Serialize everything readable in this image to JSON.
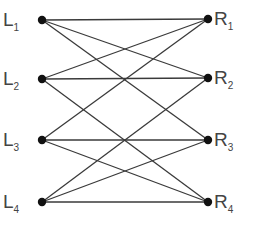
{
  "diagram": {
    "type": "bipartite-graph",
    "left_nodes": [
      {
        "id": "L1",
        "letter": "L",
        "sub": "1",
        "x": 42,
        "y": 20
      },
      {
        "id": "L2",
        "letter": "L",
        "sub": "2",
        "x": 42,
        "y": 79
      },
      {
        "id": "L3",
        "letter": "L",
        "sub": "3",
        "x": 42,
        "y": 140
      },
      {
        "id": "L4",
        "letter": "L",
        "sub": "4",
        "x": 42,
        "y": 202
      }
    ],
    "right_nodes": [
      {
        "id": "R1",
        "letter": "R",
        "sub": "1",
        "x": 208,
        "y": 19
      },
      {
        "id": "R2",
        "letter": "R",
        "sub": "2",
        "x": 208,
        "y": 78
      },
      {
        "id": "R3",
        "letter": "R",
        "sub": "3",
        "x": 208,
        "y": 140
      },
      {
        "id": "R4",
        "letter": "R",
        "sub": "4",
        "x": 208,
        "y": 202
      }
    ],
    "edges": [
      [
        "L1",
        "R1"
      ],
      [
        "L1",
        "R2"
      ],
      [
        "L1",
        "R3"
      ],
      [
        "L2",
        "R1"
      ],
      [
        "L2",
        "R2"
      ],
      [
        "L2",
        "R4"
      ],
      [
        "L3",
        "R1"
      ],
      [
        "L3",
        "R3"
      ],
      [
        "L3",
        "R4"
      ],
      [
        "L4",
        "R2"
      ],
      [
        "L4",
        "R3"
      ],
      [
        "L4",
        "R4"
      ]
    ],
    "colors": {
      "edge": "#3a3a3a",
      "node": "#111111",
      "label": "#444444"
    }
  }
}
